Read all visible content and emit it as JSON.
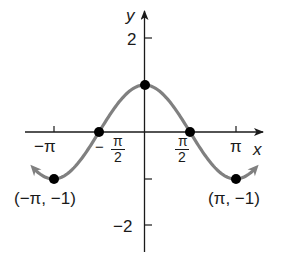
{
  "chart_data": {
    "type": "line",
    "title": "",
    "function": "y = cos x",
    "xlabel": "x",
    "ylabel": "y",
    "xlim": [
      -3.93,
      3.93
    ],
    "ylim": [
      -2.5,
      2.5
    ],
    "grid": false,
    "legend": null,
    "x_ticks": [
      {
        "value": -3.14159,
        "label": "−π"
      },
      {
        "value": -1.5708,
        "label": "−π/2"
      },
      {
        "value": 1.5708,
        "label": "π/2"
      },
      {
        "value": 3.14159,
        "label": "π"
      }
    ],
    "y_ticks": [
      {
        "value": 2,
        "label": "2"
      },
      {
        "value": -1,
        "label": ""
      },
      {
        "value": -2,
        "label": "−2"
      }
    ],
    "series": [
      {
        "name": "cos x",
        "color": "#808080",
        "x": [
          -3.9,
          -3.14159,
          -2.356,
          -1.5708,
          -0.785,
          0,
          0.785,
          1.5708,
          2.356,
          3.14159,
          3.9
        ],
        "y": [
          -0.726,
          -1,
          -0.707,
          0,
          0.707,
          1,
          0.707,
          0,
          -0.707,
          -1,
          -0.726
        ],
        "arrows_at_ends": true
      }
    ],
    "points": [
      {
        "x": -3.14159,
        "y": -1,
        "label": "(−π, −1)"
      },
      {
        "x": -1.5708,
        "y": 0,
        "label": ""
      },
      {
        "x": 0,
        "y": 1,
        "label": ""
      },
      {
        "x": 1.5708,
        "y": 0,
        "label": ""
      },
      {
        "x": 3.14159,
        "y": -1,
        "label": "(π, −1)"
      }
    ],
    "annotations": [
      "(−π, −1)",
      "(π, −1)"
    ]
  },
  "labels": {
    "y_axis": "y",
    "x_axis": "x",
    "y_tick_2": "2",
    "y_tick_neg2": "−2",
    "x_tick_neg_pi": "−π",
    "x_tick_neg_half_pi_sign": "−",
    "x_tick_pi_num": "π",
    "x_tick_half_den": "2",
    "x_tick_pi": "π",
    "point_left": "(−π, −1)",
    "point_right": "(π, −1)"
  },
  "colors": {
    "curve": "#808080",
    "axis": "#1a1a1a",
    "point": "#000000"
  }
}
